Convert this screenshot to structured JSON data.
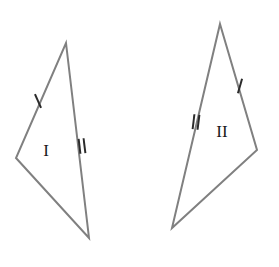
{
  "figure": {
    "background_color": "#ffffff",
    "stroke_color": "#808080",
    "stroke_width": 2,
    "tick_color": "#2b2b2b",
    "tick_width": 2,
    "label_color": "#1a1a1a",
    "width": 279,
    "height": 267
  },
  "shapes": [
    {
      "id": "shape-1",
      "label": "I",
      "label_position": {
        "x": 46,
        "y": 152
      },
      "orientation": "left",
      "vertices": [
        {
          "name": "apex",
          "x": 66,
          "y": 43
        },
        {
          "name": "bottom",
          "x": 89,
          "y": 238
        },
        {
          "name": "left",
          "x": 16,
          "y": 158
        }
      ],
      "path": "M 66 43 L 89 238 L 16 158 Z",
      "tick_marks": [
        {
          "name": "single-tick-upper-left-edge",
          "count": 1,
          "edge": "left-upper",
          "center": {
            "x": 38,
            "y": 101
          },
          "angle_deg": 66
        },
        {
          "name": "double-tick-right-edge",
          "count": 2,
          "edge": "right",
          "center": {
            "x": 82,
            "y": 146
          },
          "angle_deg": 83
        }
      ]
    },
    {
      "id": "shape-2",
      "label": "II",
      "label_position": {
        "x": 222,
        "y": 133
      },
      "orientation": "right",
      "vertices": [
        {
          "name": "apex",
          "x": 220,
          "y": 24
        },
        {
          "name": "right",
          "x": 257,
          "y": 150
        },
        {
          "name": "bottom",
          "x": 172,
          "y": 228
        }
      ],
      "path": "M 220 24 L 257 150 L 172 228 Z",
      "tick_marks": [
        {
          "name": "single-tick-upper-right-edge",
          "count": 1,
          "edge": "right-upper",
          "center": {
            "x": 240,
            "y": 86
          },
          "angle_deg": 106
        },
        {
          "name": "double-tick-left-edge",
          "count": 2,
          "edge": "left",
          "center": {
            "x": 196,
            "y": 122
          },
          "angle_deg": 97
        }
      ]
    }
  ],
  "tick_style": {
    "length": 15,
    "spacing": 5
  }
}
